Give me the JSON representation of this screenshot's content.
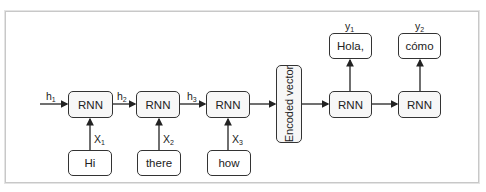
{
  "diagram": {
    "encoder": {
      "cells": [
        {
          "label": "RNN"
        },
        {
          "label": "RNN"
        },
        {
          "label": "RNN"
        }
      ],
      "inputs": [
        {
          "word": "Hi",
          "var": "X",
          "sub": "1"
        },
        {
          "word": "there",
          "var": "X",
          "sub": "2"
        },
        {
          "word": "how",
          "var": "X",
          "sub": "3"
        }
      ],
      "hidden": [
        {
          "var": "h",
          "sub": "1"
        },
        {
          "var": "h",
          "sub": "2"
        },
        {
          "var": "h",
          "sub": "3"
        }
      ]
    },
    "encoded_vector": {
      "label": "Encoded vector"
    },
    "decoder": {
      "cells": [
        {
          "label": "RNN"
        },
        {
          "label": "RNN"
        }
      ],
      "outputs": [
        {
          "word": "Hola,",
          "var": "y",
          "sub": "1"
        },
        {
          "word": "cómo",
          "var": "y",
          "sub": "2"
        }
      ]
    },
    "colors": {
      "stroke": "#333333",
      "box_fill": "#f7f7f7",
      "frame": "#c8c8c8"
    }
  }
}
